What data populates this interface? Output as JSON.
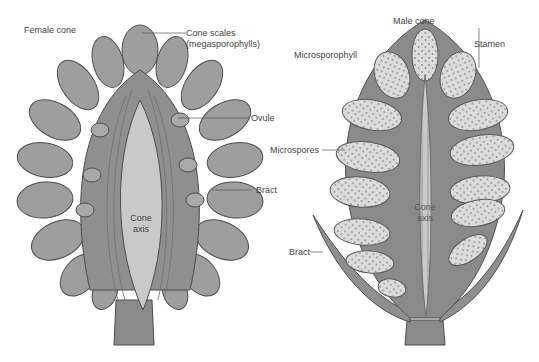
{
  "colors": {
    "background": "#ffffff",
    "tissue_dark": "#8a8a8a",
    "tissue_mid": "#9e9e9e",
    "axis_light": "#c9c9c9",
    "sporangium": "#dcdcdc",
    "spore_dot": "#8c8c8c",
    "outline": "#4d4d4d",
    "label_text": "#444444"
  },
  "female_cone": {
    "title": "Female cone",
    "labels": {
      "cone_scales": "Cone scales",
      "megasporophylls": "(megasporophylls)",
      "ovule": "Ovule",
      "bract": "Bract",
      "cone": "Cone",
      "axis": "axis"
    }
  },
  "male_cone": {
    "title": "Male cone",
    "labels": {
      "microsporophyll": "Microsporophyll",
      "stamen": "Stamen",
      "microspores": "Microspores",
      "bract": "Bract",
      "cone": "Cone",
      "axis": "axis"
    }
  }
}
